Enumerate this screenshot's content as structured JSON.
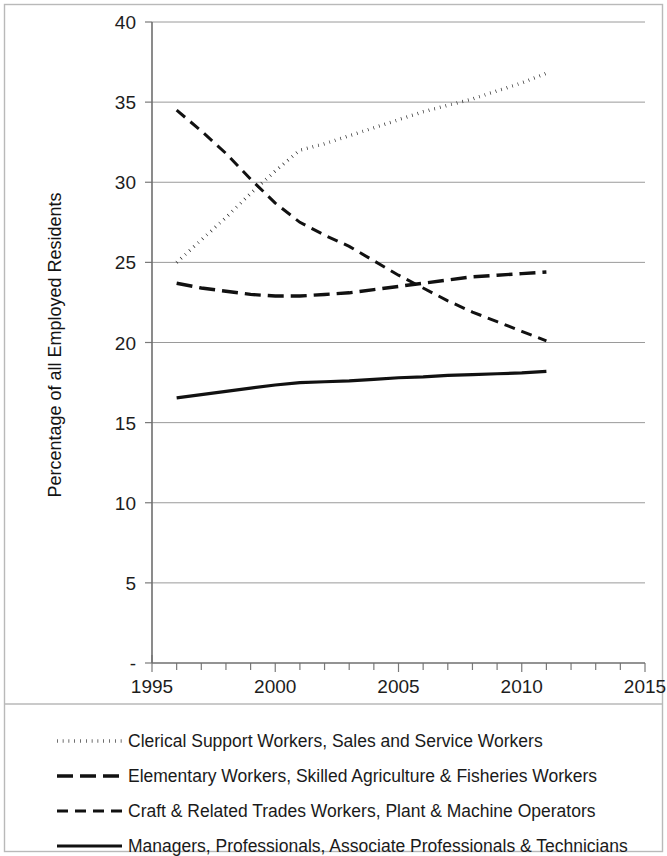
{
  "chart_data": {
    "type": "line",
    "title": "",
    "xlabel": "",
    "ylabel": "Percentage of all Employed Residents",
    "xlim": [
      1995,
      2015
    ],
    "ylim": [
      0,
      40
    ],
    "grid": true,
    "legend_position": "bottom",
    "x_ticks": [
      "1995",
      "2000",
      "2005",
      "2010",
      "2015"
    ],
    "x_tick_values": [
      1995,
      2000,
      2005,
      2010,
      2015
    ],
    "x_minor_tick_interval": 1,
    "y_ticks": [
      "-",
      "5",
      "10",
      "15",
      "20",
      "25",
      "30",
      "35",
      "40"
    ],
    "y_tick_values": [
      0,
      5,
      10,
      15,
      20,
      25,
      30,
      35,
      40
    ],
    "series": [
      {
        "name": "Clerical Support Workers, Sales and Service Workers",
        "style": "dotted",
        "x": [
          1996,
          1997,
          1998,
          1999,
          2000,
          2001,
          2002,
          2003,
          2004,
          2005,
          2006,
          2007,
          2008,
          2009,
          2010,
          2011
        ],
        "values": [
          25.0,
          26.4,
          27.8,
          29.3,
          30.7,
          32.0,
          32.4,
          32.9,
          33.4,
          33.9,
          34.4,
          34.8,
          35.2,
          35.7,
          36.2,
          36.8
        ]
      },
      {
        "name": "Elementary Workers, Skilled Agriculture & Fisheries Workers",
        "style": "long-dash",
        "x": [
          1996,
          1997,
          1998,
          1999,
          2000,
          2001,
          2002,
          2003,
          2004,
          2005,
          2006,
          2007,
          2008,
          2009,
          2010,
          2011
        ],
        "values": [
          23.7,
          23.4,
          23.2,
          23.0,
          22.9,
          22.9,
          23.0,
          23.1,
          23.3,
          23.5,
          23.7,
          23.9,
          24.1,
          24.2,
          24.3,
          24.4
        ]
      },
      {
        "name": "Craft & Related Trades Workers, Plant & Machine Operators",
        "style": "short-dash",
        "x": [
          1996,
          1997,
          1998,
          1999,
          2000,
          2001,
          2002,
          2003,
          2004,
          2005,
          2006,
          2007,
          2008,
          2009,
          2010,
          2011
        ],
        "values": [
          34.5,
          33.2,
          31.8,
          30.2,
          28.7,
          27.5,
          26.7,
          26.0,
          25.1,
          24.2,
          23.4,
          22.6,
          21.9,
          21.3,
          20.7,
          20.1
        ]
      },
      {
        "name": "Managers, Professionals, Associate Professionals & Technicians",
        "style": "solid",
        "x": [
          1996,
          1997,
          1998,
          1999,
          2000,
          2001,
          2002,
          2003,
          2004,
          2005,
          2006,
          2007,
          2008,
          2009,
          2010,
          2011
        ],
        "values": [
          16.55,
          16.75,
          16.95,
          17.15,
          17.35,
          17.5,
          17.55,
          17.6,
          17.7,
          17.8,
          17.85,
          17.95,
          18.0,
          18.05,
          18.1,
          18.2
        ]
      }
    ]
  },
  "axis": {
    "y_title": "Percentage of all Employed Residents",
    "y_labels": [
      "40",
      "35",
      "30",
      "25",
      "20",
      "15",
      "10",
      "5",
      "-"
    ],
    "x_labels": [
      "1995",
      "2000",
      "2005",
      "2010",
      "2015"
    ]
  },
  "legend": {
    "items": [
      {
        "label": "Clerical Support Workers, Sales and Service Workers",
        "style": "dotted"
      },
      {
        "label": "Elementary Workers, Skilled Agriculture & Fisheries Workers",
        "style": "long-dash"
      },
      {
        "label": "Craft & Related Trades Workers, Plant & Machine Operators",
        "style": "short-dash"
      },
      {
        "label": "Managers, Professionals, Associate Professionals & Technicians",
        "style": "solid"
      }
    ]
  },
  "colors": {
    "ink": "#111111",
    "grid": "#9a9a9a",
    "frame": "#b9b9b9"
  }
}
